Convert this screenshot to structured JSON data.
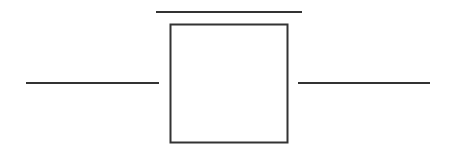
{
  "diagram": {
    "type": "schematic",
    "elements": [
      {
        "id": "top-bar",
        "kind": "line"
      },
      {
        "id": "component-box",
        "kind": "rectangle"
      },
      {
        "id": "left-lead",
        "kind": "line"
      },
      {
        "id": "right-lead",
        "kind": "line"
      }
    ],
    "stroke_color": "#333333",
    "background_color": "#ffffff"
  }
}
